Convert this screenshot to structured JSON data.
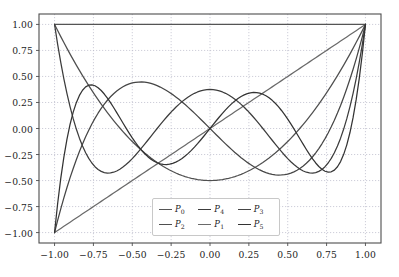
{
  "chart_data": {
    "type": "line",
    "title": "",
    "subtitle": "",
    "xlabel": "",
    "ylabel": "",
    "xlim": [
      -1.1,
      1.1
    ],
    "ylim": [
      -1.1,
      1.1
    ],
    "grid": true,
    "grid_style": "dotted",
    "legend_position": "lower center",
    "legend_columns": 3,
    "x_ticks": [
      -1.0,
      -0.75,
      -0.5,
      -0.25,
      0.0,
      0.25,
      0.5,
      0.75,
      1.0
    ],
    "x_tick_labels": [
      "−1.00",
      "−0.75",
      "−0.50",
      "−0.25",
      "0.00",
      "0.25",
      "0.50",
      "0.75",
      "1.00"
    ],
    "y_ticks": [
      -1.0,
      -0.75,
      -0.5,
      -0.25,
      0.0,
      0.25,
      0.5,
      0.75,
      1.0
    ],
    "y_tick_labels": [
      "−1.00",
      "−0.75",
      "−0.50",
      "−0.25",
      "0.00",
      "0.25",
      "0.50",
      "0.75",
      "1.00"
    ],
    "x": [
      -1.0,
      -0.98,
      -0.96,
      -0.94,
      -0.92,
      -0.9,
      -0.88,
      -0.86,
      -0.84,
      -0.82,
      -0.8,
      -0.78,
      -0.76,
      -0.74,
      -0.72,
      -0.7,
      -0.68,
      -0.66,
      -0.64,
      -0.62,
      -0.6,
      -0.58,
      -0.56,
      -0.54,
      -0.52,
      -0.5,
      -0.48,
      -0.46,
      -0.44,
      -0.42,
      -0.4,
      -0.38,
      -0.36,
      -0.34,
      -0.32,
      -0.3,
      -0.28,
      -0.26,
      -0.24,
      -0.22,
      -0.2,
      -0.18,
      -0.16,
      -0.14,
      -0.12,
      -0.1,
      -0.08,
      -0.06,
      -0.04,
      -0.02,
      0.0,
      0.02,
      0.04,
      0.06,
      0.08,
      0.1,
      0.12,
      0.14,
      0.16,
      0.18,
      0.2,
      0.22,
      0.24,
      0.26,
      0.28,
      0.3,
      0.32,
      0.34,
      0.36,
      0.38,
      0.4,
      0.42,
      0.44,
      0.46,
      0.48,
      0.5,
      0.52,
      0.54,
      0.56,
      0.58,
      0.6,
      0.62,
      0.64,
      0.66,
      0.68,
      0.7,
      0.72,
      0.74,
      0.76,
      0.78,
      0.8,
      0.82,
      0.84,
      0.86,
      0.88,
      0.9,
      0.92,
      0.94,
      0.96,
      0.98,
      1.0
    ],
    "series": [
      {
        "name": "P0",
        "label": "P",
        "subscript": "0",
        "color": "#555555",
        "degree": 0,
        "description": "P0(x) = 1",
        "notable_points": [
          {
            "x": -1,
            "y": 1
          },
          {
            "x": 0,
            "y": 1
          },
          {
            "x": 1,
            "y": 1
          }
        ]
      },
      {
        "name": "P1",
        "label": "P",
        "subscript": "1",
        "color": "#6a6a6a",
        "degree": 1,
        "description": "P1(x) = x",
        "notable_points": [
          {
            "x": -1,
            "y": -1
          },
          {
            "x": 0,
            "y": 0
          },
          {
            "x": 1,
            "y": 1
          }
        ]
      },
      {
        "name": "P2",
        "label": "P",
        "subscript": "2",
        "color": "#4f4f4f",
        "degree": 2,
        "description": "P2(x) = (3x^2 - 1)/2",
        "notable_points": [
          {
            "x": -1,
            "y": 1
          },
          {
            "x": 0,
            "y": -0.5
          },
          {
            "x": 1,
            "y": 1
          }
        ]
      },
      {
        "name": "P3",
        "label": "P",
        "subscript": "3",
        "color": "#454545",
        "degree": 3,
        "description": "P3(x) = (5x^3 - 3x)/2",
        "notable_points": [
          {
            "x": -1,
            "y": -1
          },
          {
            "x": -0.4472,
            "y": 0.3849
          },
          {
            "x": 0,
            "y": 0
          },
          {
            "x": 0.4472,
            "y": -0.3849
          },
          {
            "x": 1,
            "y": 1
          }
        ]
      },
      {
        "name": "P4",
        "label": "P",
        "subscript": "4",
        "color": "#3c3c3c",
        "degree": 4,
        "description": "P4(x) = (35x^4 - 30x^2 + 3)/8",
        "notable_points": [
          {
            "x": -1,
            "y": 1
          },
          {
            "x": -0.6547,
            "y": -0.4286
          },
          {
            "x": 0,
            "y": 0.375
          },
          {
            "x": 0.6547,
            "y": -0.4286
          },
          {
            "x": 1,
            "y": 1
          }
        ]
      },
      {
        "name": "P5",
        "label": "P",
        "subscript": "5",
        "color": "#333333",
        "degree": 5,
        "description": "P5(x) = (63x^5 - 70x^3 + 15x)/8",
        "notable_points": [
          {
            "x": -1,
            "y": -1
          },
          {
            "x": -0.7651,
            "y": 0.4196
          },
          {
            "x": -0.2852,
            "y": -0.3466
          },
          {
            "x": 0,
            "y": 0
          },
          {
            "x": 0.2852,
            "y": 0.3466
          },
          {
            "x": 0.7651,
            "y": -0.4196
          },
          {
            "x": 1,
            "y": 1
          }
        ]
      }
    ],
    "legend_entries": [
      {
        "label": "P",
        "subscript": "0",
        "color": "#555555"
      },
      {
        "label": "P",
        "subscript": "2",
        "color": "#4f4f4f"
      },
      {
        "label": "P",
        "subscript": "4",
        "color": "#3c3c3c"
      },
      {
        "label": "P",
        "subscript": "1",
        "color": "#6a6a6a"
      },
      {
        "label": "P",
        "subscript": "3",
        "color": "#454545"
      },
      {
        "label": "P",
        "subscript": "5",
        "color": "#333333"
      }
    ],
    "colors": {
      "background": "#ffffff",
      "axes_frame": "#4d4d4d",
      "grid": "#b9b9c8",
      "tick_text": "#1c1c1c",
      "legend_border": "#c8c8c8"
    }
  }
}
